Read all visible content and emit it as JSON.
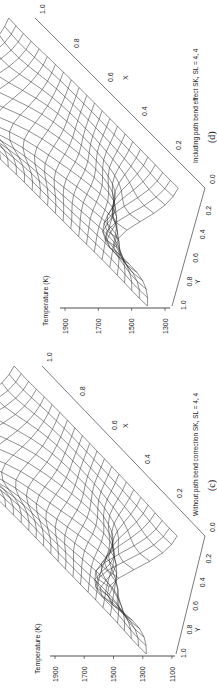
{
  "figure": {
    "panels": [
      {
        "id": "c",
        "panel_label": "(c)",
        "caption": "Without path bend correction SK, SL = 4, 4",
        "z_axis_title": "Temperature (K)",
        "z_ticks": [
          "1100",
          "1300",
          "1500",
          "1700",
          "1900"
        ],
        "x_axis_label": "X",
        "x_ticks": [
          "0.0",
          "0.2",
          "0.4",
          "0.6",
          "0.8",
          "1.0"
        ],
        "y_axis_label": "Y",
        "y_ticks": [
          "0.2",
          "0.4",
          "0.6",
          "0.8",
          "1.0"
        ]
      },
      {
        "id": "d",
        "panel_label": "(d)",
        "caption": "Including path bend effect SK, SL = 4, 4",
        "z_axis_title": "Temperature (K)",
        "z_ticks": [
          "1300",
          "1500",
          "1700",
          "1900"
        ],
        "x_axis_label": "X",
        "x_ticks": [
          "0.0",
          "0.2",
          "0.4",
          "0.6",
          "0.8",
          "1.0"
        ],
        "y_axis_label": "Y",
        "y_ticks": [
          "0.2",
          "0.4",
          "0.6",
          "0.8",
          "1.0"
        ]
      }
    ]
  },
  "chart_data": [
    {
      "type": "surface",
      "title": "(c) Without path bend correction SK, SL = 4, 4",
      "xlabel": "X",
      "ylabel": "Y",
      "zlabel": "Temperature (K)",
      "xlim": [
        0,
        1
      ],
      "ylim": [
        0,
        1
      ],
      "zlim": [
        1100,
        1900
      ],
      "x_ticks": [
        0.0,
        0.2,
        0.4,
        0.6,
        0.8,
        1.0
      ],
      "y_ticks": [
        0.2,
        0.4,
        0.6,
        0.8,
        1.0
      ],
      "z_ticks": [
        1100,
        1300,
        1500,
        1700,
        1900
      ],
      "description": "Wireframe temperature surface with a peak (~1900 K) near X≈0.05, Y≈0.5 and a ridge toward X≈1.0, lower (~1100 K) at Y edges",
      "grid_lines": "on"
    },
    {
      "type": "surface",
      "title": "(d) Including path bend effect SK, SL = 4, 4",
      "xlabel": "X",
      "ylabel": "Y",
      "zlabel": "Temperature (K)",
      "xlim": [
        0,
        1
      ],
      "ylim": [
        0,
        1
      ],
      "zlim": [
        1200,
        1900
      ],
      "x_ticks": [
        0.0,
        0.2,
        0.4,
        0.6,
        0.8,
        1.0
      ],
      "y_ticks": [
        0.2,
        0.4,
        0.6,
        0.8,
        1.0
      ],
      "z_ticks": [
        1300,
        1500,
        1700,
        1900
      ],
      "description": "Wireframe temperature surface with a peak (~1900 K) near X≈0.05, Y≈0.5 and a second ridge toward X≈0.9, lower (~1250 K) at Y edges",
      "grid_lines": "on"
    }
  ]
}
